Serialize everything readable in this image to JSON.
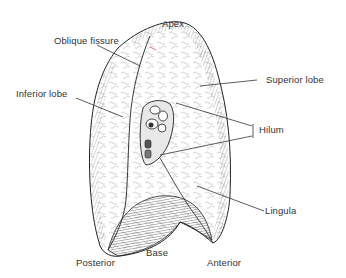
{
  "figure": {
    "labels": {
      "apex": "Apex",
      "oblique_fissure": "Oblique fissure",
      "superior_lobe": "Superior lobe",
      "inferior_lobe": "Inferior lobe",
      "hilum": "Hilum",
      "lingula": "Lingula",
      "base": "Base",
      "posterior": "Posterior",
      "anterior": "Anterior"
    },
    "colors": {
      "line": "#2a2a2a",
      "text": "#333333",
      "background": "#ffffff",
      "fissure_accent": "#d9534f"
    }
  }
}
